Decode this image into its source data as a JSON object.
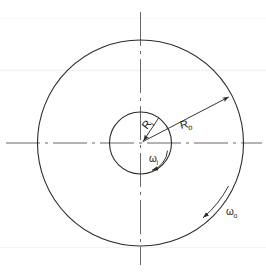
{
  "figure": {
    "background_color": "#ffffff",
    "line_color": "#2b2b2b",
    "centerline_color": "#4a4a4a",
    "artifact_color": "#f0f0f0"
  },
  "geometry": {
    "center_x": 140.5,
    "center_y": 143,
    "inner_radius": 31,
    "outer_radius": 103,
    "vertical_centerline": {
      "x": 140.5,
      "y1": 12,
      "y2": 265
    },
    "horizontal_centerline": {
      "y": 143,
      "x1": 6,
      "x2": 262
    }
  },
  "labels": {
    "inner_radius": {
      "symbol": "R",
      "subscript": "i",
      "text": "Ri",
      "x": 148,
      "y": 126,
      "rotation": -52
    },
    "outer_radius": {
      "symbol": "R",
      "subscript": "o",
      "text": "Ro",
      "x": 188,
      "y": 128,
      "rotation": -13
    },
    "inner_omega": {
      "symbol": "ω",
      "subscript": "i",
      "text": "ωi",
      "x": 152,
      "y": 162,
      "rotation": 0
    },
    "outer_omega": {
      "symbol": "ω",
      "subscript": "o",
      "text": "ωo",
      "x": 228,
      "y": 213,
      "rotation": 0
    }
  },
  "annotations": {
    "inner_radius_leader": {
      "name": "inner-radius-arrow",
      "description": "Arrow from inner circle edge pointing to center",
      "from_angle_deg": 54,
      "arrow_at": "center"
    },
    "outer_radius_leader": {
      "name": "outer-radius-arrow",
      "description": "Arrow from center pointing to outer circle edge",
      "to_angle_deg": 28,
      "arrow_at": "outer-edge"
    },
    "inner_rotation_arc": {
      "name": "inner-angular-velocity-arc",
      "description": "Curved arrow inside inner circle indicating rotation",
      "arrow_at": "lower-left"
    },
    "outer_rotation_arc": {
      "name": "outer-angular-velocity-arc",
      "description": "Curved arrow outside lower-right of outer circle indicating rotation",
      "arrow_at": "lower-left"
    }
  },
  "shapes": {
    "outer_circle_name": "outer-cylinder-circle",
    "inner_circle_name": "inner-cylinder-circle"
  }
}
